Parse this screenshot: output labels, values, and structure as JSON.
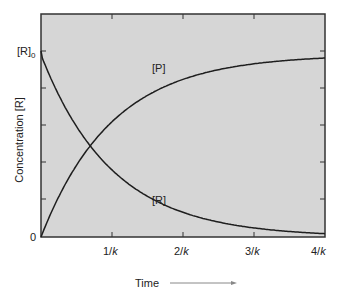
{
  "chart_data": {
    "type": "line",
    "title": "",
    "xlabel": "Time",
    "ylabel": "Concentration [R]",
    "x_ticks": [
      "1/k",
      "2/k",
      "3/k",
      "4/k"
    ],
    "y_ticks": [
      "0",
      "[R]0"
    ],
    "xlim": [
      0,
      4
    ],
    "ylim": [
      0,
      1.0
    ],
    "grid": false,
    "legend": "inline labels",
    "series": [
      {
        "name": "[R]",
        "formula": "[R]0 * exp(-k t)",
        "x": [
          0,
          0.5,
          1,
          1.5,
          2,
          2.5,
          3,
          3.5,
          4
        ],
        "values": [
          1.0,
          0.61,
          0.37,
          0.22,
          0.14,
          0.08,
          0.05,
          0.03,
          0.02
        ]
      },
      {
        "name": "[P]",
        "formula": "[R]0 * (1 - exp(-k t))",
        "x": [
          0,
          0.5,
          1,
          1.5,
          2,
          2.5,
          3,
          3.5,
          4
        ],
        "values": [
          0.0,
          0.39,
          0.63,
          0.78,
          0.86,
          0.92,
          0.95,
          0.97,
          0.98
        ]
      }
    ],
    "annotations": [
      "[P]",
      "[R]"
    ]
  },
  "labels": {
    "y_axis": "Concentration [R]",
    "x_axis": "Time",
    "y_top": "[R]",
    "y_top_sub": "0",
    "y_zero": "0",
    "x1": "1/",
    "x2": "2/",
    "x3": "3/",
    "x4": "4/",
    "k": "k",
    "series_p": "[P]",
    "series_r": "[R]"
  },
  "colors": {
    "plot_bg": "#d6d6d6",
    "line": "#1e1e1e",
    "axis": "#333333",
    "arrow": "#888888"
  }
}
